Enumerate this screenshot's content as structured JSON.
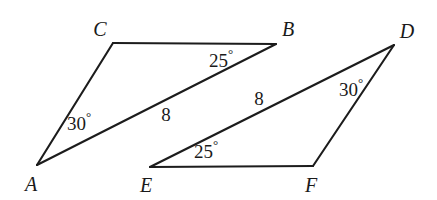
{
  "figure": {
    "background_color": "#ffffff",
    "stroke_color": "#1c1c1c",
    "text_color": "#1a1a1a"
  },
  "vertices": {
    "A": {
      "label": "A",
      "x": 37,
      "y": 165,
      "label_x": 31,
      "label_y": 184
    },
    "B": {
      "label": "B",
      "x": 276,
      "y": 44,
      "label_x": 288,
      "label_y": 29
    },
    "C": {
      "label": "C",
      "x": 113,
      "y": 43,
      "label_x": 100,
      "label_y": 29
    },
    "D": {
      "label": "D",
      "x": 394,
      "y": 45,
      "label_x": 407,
      "label_y": 31
    },
    "E": {
      "label": "E",
      "x": 150,
      "y": 167,
      "label_x": 146,
      "label_y": 185
    },
    "F": {
      "label": "F",
      "x": 313,
      "y": 166,
      "label_x": 311,
      "label_y": 185
    }
  },
  "triangles": [
    {
      "name": "triangle-abc",
      "vertex_order": [
        "A",
        "C",
        "B"
      ],
      "angles": [
        {
          "at": "A",
          "value": "30",
          "unit": "°",
          "text": "30°"
        },
        {
          "at": "B",
          "value": "25",
          "unit": "°",
          "text": "25°"
        }
      ],
      "sides": [
        {
          "from": "A",
          "to": "B",
          "length": "8"
        }
      ]
    },
    {
      "name": "triangle-def",
      "vertex_order": [
        "E",
        "F",
        "D"
      ],
      "angles": [
        {
          "at": "E",
          "value": "25",
          "unit": "°",
          "text": "25°"
        },
        {
          "at": "D",
          "value": "30",
          "unit": "°",
          "text": "30°"
        }
      ],
      "sides": [
        {
          "from": "E",
          "to": "D",
          "length": "8"
        }
      ]
    }
  ],
  "annotations": {
    "angle_a": {
      "number": "30",
      "degree": "°",
      "x": 79,
      "y": 122
    },
    "angle_b": {
      "number": "25",
      "degree": "°",
      "x": 221,
      "y": 59
    },
    "angle_e": {
      "number": "25",
      "degree": "°",
      "x": 206,
      "y": 150
    },
    "angle_d": {
      "number": "30",
      "degree": "°",
      "x": 351,
      "y": 88
    },
    "side_ab": {
      "text": "8",
      "x": 166,
      "y": 114
    },
    "side_ed": {
      "text": "8",
      "x": 259,
      "y": 98
    }
  }
}
